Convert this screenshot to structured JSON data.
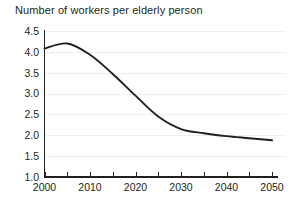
{
  "chart_data": {
    "type": "line",
    "title": "Number of workers per elderly person",
    "xlabel": "",
    "ylabel": "",
    "xlim": [
      2000,
      2050
    ],
    "ylim": [
      1.0,
      4.5
    ],
    "grid": true,
    "legend": "none",
    "y_ticks": [
      "1.0",
      "1.5",
      "2.0",
      "2.5",
      "3.0",
      "3.5",
      "4.0",
      "4.5"
    ],
    "y_tick_values": [
      1.0,
      1.5,
      2.0,
      2.5,
      3.0,
      3.5,
      4.0,
      4.5
    ],
    "x_ticks": [
      "2000",
      "2010",
      "2020",
      "2030",
      "2040",
      "2050"
    ],
    "x_tick_values": [
      2000,
      2010,
      2020,
      2030,
      2040,
      2050
    ],
    "x_minor_tick_values": [
      2000,
      2005,
      2010,
      2015,
      2020,
      2025,
      2030,
      2035,
      2040,
      2045,
      2050
    ],
    "x": [
      2000,
      2005,
      2010,
      2015,
      2020,
      2025,
      2030,
      2035,
      2040,
      2045,
      2050
    ],
    "values": [
      4.08,
      4.2,
      3.93,
      3.47,
      2.95,
      2.45,
      2.15,
      2.05,
      1.98,
      1.93,
      1.88
    ],
    "series": [
      {
        "name": "Workers per elderly person",
        "values": [
          4.08,
          4.2,
          3.93,
          3.47,
          2.95,
          2.45,
          2.15,
          2.05,
          1.98,
          1.93,
          1.88
        ]
      }
    ],
    "line_color": "#231f20",
    "grid_color": "#eceef0",
    "axis_color": "#231f20",
    "background_color": "#ffffff"
  }
}
